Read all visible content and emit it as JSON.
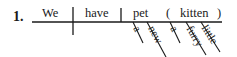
{
  "item_number": "1.",
  "diagram": {
    "subject": "We",
    "verb": "have",
    "direct_object": "pet",
    "appositive": "kitten",
    "appositive_open": "(",
    "appositive_close": ")",
    "modifiers_pet": [
      "a",
      "new"
    ],
    "modifiers_kitten": [
      "a",
      "furry",
      "little"
    ]
  }
}
